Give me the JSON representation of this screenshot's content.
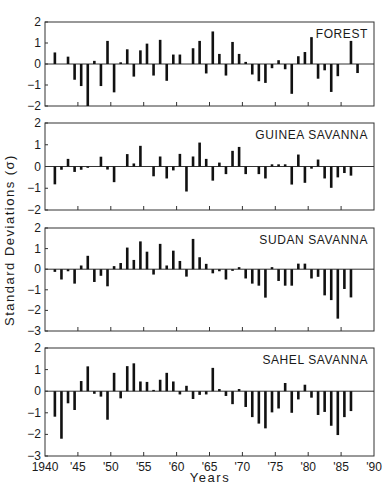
{
  "figure": {
    "xlabel": "Years",
    "ylabel": "Standard Deviations (σ)",
    "x_ticks": [
      {
        "year": 1940,
        "label": "1940"
      },
      {
        "year": 1945,
        "label": "'45"
      },
      {
        "year": 1950,
        "label": "'50"
      },
      {
        "year": 1955,
        "label": "'55"
      },
      {
        "year": 1960,
        "label": "'60"
      },
      {
        "year": 1965,
        "label": "'65"
      },
      {
        "year": 1970,
        "label": "'70"
      },
      {
        "year": 1975,
        "label": "'75"
      },
      {
        "year": 1980,
        "label": "'80"
      },
      {
        "year": 1985,
        "label": "'85"
      },
      {
        "year": 1990,
        "label": "'90"
      }
    ],
    "bar_color": "#111111",
    "frame_color": "#333333"
  },
  "chart_data": [
    {
      "type": "bar",
      "title": "FOREST",
      "xlabel": "Years",
      "ylabel": "Standard Deviations (σ)",
      "xlim": [
        1940,
        1990
      ],
      "ylim": [
        -2,
        2
      ],
      "yticks": [
        2,
        1,
        0,
        -1,
        -2
      ],
      "grid": false,
      "x": [
        1941,
        1942,
        1943,
        1944,
        1945,
        1946,
        1947,
        1948,
        1949,
        1950,
        1951,
        1952,
        1953,
        1954,
        1955,
        1956,
        1957,
        1958,
        1959,
        1960,
        1961,
        1962,
        1963,
        1964,
        1965,
        1966,
        1967,
        1968,
        1969,
        1970,
        1971,
        1972,
        1973,
        1974,
        1975,
        1976,
        1977,
        1978,
        1979,
        1980,
        1981,
        1982,
        1983,
        1984,
        1985,
        1986,
        1987
      ],
      "values": [
        0.55,
        0,
        0.35,
        -0.75,
        -1.05,
        -2.0,
        0.15,
        -1.05,
        1.1,
        -1.35,
        0.08,
        0.7,
        -0.6,
        0.65,
        0.97,
        -0.55,
        1.15,
        -0.8,
        0.45,
        0.45,
        0,
        0.75,
        1.1,
        -0.45,
        1.55,
        0.48,
        -0.55,
        1.05,
        0.48,
        0.1,
        -0.5,
        -0.82,
        -0.9,
        -0.2,
        0.18,
        -0.25,
        -1.42,
        0.37,
        0.57,
        1.28,
        -0.7,
        -0.3,
        -1.33,
        -0.58,
        0,
        1.1,
        -0.43
      ]
    },
    {
      "type": "bar",
      "title": "GUINEA SAVANNA",
      "xlabel": "Years",
      "ylabel": "Standard Deviations (σ)",
      "xlim": [
        1940,
        1990
      ],
      "ylim": [
        -2,
        2
      ],
      "yticks": [
        2,
        1,
        0,
        -1,
        -2
      ],
      "grid": false,
      "x": [
        1941,
        1942,
        1943,
        1944,
        1945,
        1946,
        1947,
        1948,
        1949,
        1950,
        1951,
        1952,
        1953,
        1954,
        1955,
        1956,
        1957,
        1958,
        1959,
        1960,
        1961,
        1962,
        1963,
        1964,
        1965,
        1966,
        1967,
        1968,
        1969,
        1970,
        1971,
        1972,
        1973,
        1974,
        1975,
        1976,
        1977,
        1978,
        1979,
        1980,
        1981,
        1982,
        1983,
        1984,
        1985,
        1986
      ],
      "values": [
        -0.82,
        -0.15,
        0.35,
        -0.25,
        -0.15,
        -0.06,
        0,
        0.45,
        -0.14,
        -0.72,
        0,
        0.57,
        0.14,
        0.95,
        0,
        -0.45,
        0.46,
        -0.55,
        -0.18,
        0.58,
        -1.15,
        0.46,
        1.1,
        0.35,
        -0.65,
        0.18,
        -0.35,
        0.72,
        0.9,
        -0.35,
        0,
        -0.35,
        -0.55,
        0.1,
        0.1,
        0.1,
        -0.83,
        0.55,
        -0.75,
        -0.1,
        0.32,
        -0.55,
        -0.98,
        -0.5,
        -0.3,
        -0.42
      ]
    },
    {
      "type": "bar",
      "title": "SUDAN SAVANNA",
      "xlabel": "Years",
      "ylabel": "Standard Deviations (σ)",
      "xlim": [
        1940,
        1990
      ],
      "ylim": [
        -3,
        2
      ],
      "yticks": [
        2,
        1,
        0,
        -1,
        -2,
        -3
      ],
      "grid": false,
      "x": [
        1941,
        1942,
        1943,
        1944,
        1945,
        1946,
        1947,
        1948,
        1949,
        1950,
        1951,
        1952,
        1953,
        1954,
        1955,
        1956,
        1957,
        1958,
        1959,
        1960,
        1961,
        1962,
        1963,
        1964,
        1965,
        1966,
        1967,
        1968,
        1969,
        1970,
        1971,
        1972,
        1973,
        1974,
        1975,
        1976,
        1977,
        1978,
        1979,
        1980,
        1981,
        1982,
        1983,
        1984,
        1985,
        1986
      ],
      "values": [
        -0.13,
        -0.5,
        -0.1,
        -0.7,
        0.18,
        0.65,
        -0.62,
        -0.32,
        -0.83,
        0.15,
        0.3,
        1.05,
        0.45,
        1.35,
        0.85,
        -0.26,
        1.23,
        0.18,
        0.9,
        0.4,
        -0.36,
        1.47,
        0.58,
        0.26,
        -0.2,
        -0.1,
        -0.5,
        -0.08,
        0.1,
        -0.45,
        -0.7,
        -0.8,
        -1.38,
        0.1,
        -0.57,
        -0.8,
        -0.8,
        0.27,
        0.27,
        -0.45,
        -0.37,
        -1.27,
        -1.5,
        -2.4,
        -0.96,
        -1.37
      ]
    },
    {
      "type": "bar",
      "title": "SAHEL SAVANNA",
      "xlabel": "Years",
      "ylabel": "Standard Deviations (σ)",
      "xlim": [
        1940,
        1990
      ],
      "ylim": [
        -3,
        2
      ],
      "yticks": [
        2,
        1,
        0,
        -1,
        -2,
        -3
      ],
      "grid": false,
      "x": [
        1941,
        1942,
        1943,
        1944,
        1945,
        1946,
        1947,
        1948,
        1949,
        1950,
        1951,
        1952,
        1953,
        1954,
        1955,
        1956,
        1957,
        1958,
        1959,
        1960,
        1961,
        1962,
        1963,
        1964,
        1965,
        1966,
        1967,
        1968,
        1969,
        1970,
        1971,
        1972,
        1973,
        1974,
        1975,
        1976,
        1977,
        1978,
        1979,
        1980,
        1981,
        1982,
        1983,
        1984,
        1985,
        1986
      ],
      "values": [
        -1.18,
        -2.2,
        -0.56,
        -0.87,
        0.47,
        1.15,
        -0.12,
        -0.25,
        -1.32,
        0.85,
        -0.33,
        1.16,
        1.29,
        0.45,
        0.43,
        0.06,
        0.53,
        0.85,
        0.45,
        -0.15,
        0.25,
        -0.36,
        -0.17,
        -0.15,
        1.08,
        0.1,
        -0.22,
        -0.6,
        0.1,
        -0.73,
        -1.2,
        -1.5,
        -1.72,
        -0.98,
        -0.8,
        0.38,
        -1.0,
        -0.38,
        0.3,
        -0.3,
        -1.1,
        -0.96,
        -1.6,
        -2.03,
        -1.2,
        -0.92
      ]
    }
  ],
  "layout": {
    "plot_left": 45,
    "plot_right": 374,
    "panels": [
      {
        "top": 22,
        "bottom": 106
      },
      {
        "top": 123,
        "bottom": 210
      },
      {
        "top": 228,
        "bottom": 331
      },
      {
        "top": 348,
        "bottom": 456
      }
    ]
  }
}
